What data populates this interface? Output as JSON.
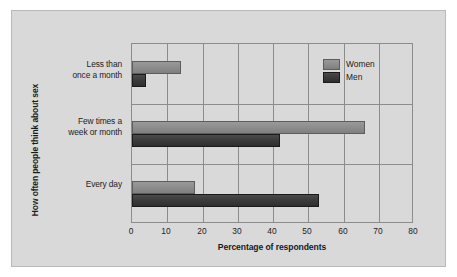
{
  "chart_data": {
    "type": "bar",
    "orientation": "horizontal",
    "title": "",
    "xlabel": "Percentage of respondents",
    "ylabel": "How often people think about sex",
    "categories": [
      "Less than once a month",
      "Few times a week or month",
      "Every day"
    ],
    "category_lines": [
      [
        "Less than",
        "once a month"
      ],
      [
        "Few times a",
        "week or month"
      ],
      [
        "Every day"
      ]
    ],
    "series": [
      {
        "name": "Women",
        "values": [
          14,
          66,
          18
        ],
        "color": "#8e8e8e"
      },
      {
        "name": "Men",
        "values": [
          4,
          42,
          53
        ],
        "color": "#3c3c3c"
      }
    ],
    "xlim": [
      0,
      80
    ],
    "xticks": [
      0,
      10,
      20,
      30,
      40,
      50,
      60,
      70,
      80
    ],
    "xtick_labels": [
      "0",
      "10",
      "20",
      "30",
      "40",
      "50",
      "60",
      "70",
      "80"
    ],
    "grid": "vertical-and-category",
    "legend_position": "top-right",
    "legend_entries": [
      "Women",
      "Men"
    ],
    "background_color": "#d9d9d9",
    "axis_color": "#8c8c8c"
  }
}
